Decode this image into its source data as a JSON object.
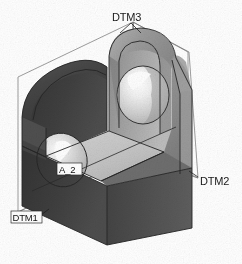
{
  "view": {
    "title": "Isometric CAD Model View",
    "background_color": "#ffffff",
    "render_style": "shaded-grayscale",
    "projection": "isometric"
  },
  "model": {
    "name": "saddle-bracket",
    "description": "U-shaped saddle block with two coaxial through holes and a rounded top arch",
    "shading": {
      "front_face_color": "#3d3d3d",
      "left_face_color": "#4a4a4a",
      "right_face_color": "#8f8f8f",
      "top_arch_color": "#9c9c9c",
      "inner_floor_color": "#c9c9c9",
      "inner_wall_color": "#a8a8a8",
      "hole_bore_color": "#dcdcdc",
      "highlight_color": "#ffffff",
      "edge_color": "#2b2b2b",
      "wireframe_color": "#6f6f6f"
    }
  },
  "annotations": [
    {
      "id": "dtm3",
      "label": "DTM3",
      "type": "datum-plane",
      "x": 113,
      "y": 18,
      "leader_from": [
        131,
        22
      ],
      "leader_to": [
        140,
        32
      ]
    },
    {
      "id": "dtm2",
      "label": "DTM2",
      "type": "datum-plane",
      "x": 200,
      "y": 182,
      "leader_from": [
        199,
        178
      ],
      "leader_to": [
        190,
        172
      ]
    },
    {
      "id": "dtm1",
      "label": "DTM1",
      "type": "datum-plane",
      "x": 14,
      "y": 220,
      "leader_from": [
        40,
        216
      ],
      "leader_to": [
        48,
        210
      ]
    },
    {
      "id": "a2",
      "label": "A_2",
      "type": "axis",
      "x": 60,
      "y": 172,
      "boxed": true
    }
  ]
}
